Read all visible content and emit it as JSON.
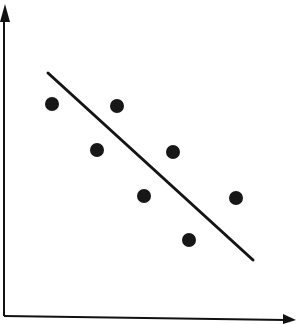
{
  "figure": {
    "kind": "scatter-plot-with-trend-line",
    "width": 297,
    "height": 324,
    "background_color": "#ffffff",
    "ink_color": "#171717",
    "title": "",
    "subtitle": ""
  },
  "axes": {
    "y_axis": {
      "label": "",
      "color": "#111111",
      "stroke_width": 2,
      "x": 4,
      "y_top": 16,
      "y_bottom": 316,
      "arrow": {
        "name": "y-axis-arrowhead",
        "direction": "up",
        "tip_x": 5,
        "tip_y": 4,
        "left_x": 0,
        "right_x": 10,
        "base_y": 22
      }
    },
    "x_axis": {
      "label": "",
      "color": "#111111",
      "stroke_width": 2,
      "x_left": 4,
      "y_left": 316,
      "x_right": 285,
      "y_right": 320,
      "arrow": {
        "name": "x-axis-arrowhead",
        "direction": "right",
        "tip_x": 296,
        "tip_y": 320,
        "top_y": 314,
        "bottom_y": 324,
        "base_x": 283
      }
    }
  },
  "trend_line": {
    "name": "regression-line",
    "color": "#141414",
    "stroke_width": 3,
    "x1": 48,
    "y1": 73,
    "x2": 253,
    "y2": 260,
    "direction": "negative"
  },
  "chart_data": {
    "type": "scatter",
    "title": "",
    "xlabel": "",
    "ylabel": "",
    "grid": false,
    "legend": false,
    "legend_position": "none",
    "xlim": [
      0,
      297
    ],
    "ylim": [
      0,
      324
    ],
    "axis_ticks": {
      "x": [],
      "y": []
    },
    "point_radius": 7,
    "point_color": "#171717",
    "series": [
      {
        "name": "observations",
        "marker": "filled-circle",
        "color": "#171717",
        "points": [
          {
            "id": "p1",
            "cx": 52,
            "cy": 104
          },
          {
            "id": "p2",
            "cx": 117,
            "cy": 106
          },
          {
            "id": "p3",
            "cx": 97,
            "cy": 150
          },
          {
            "id": "p4",
            "cx": 173,
            "cy": 152
          },
          {
            "id": "p5",
            "cx": 144,
            "cy": 196
          },
          {
            "id": "p6",
            "cx": 236,
            "cy": 198
          },
          {
            "id": "p7",
            "cx": 189,
            "cy": 240
          }
        ]
      }
    ],
    "fit_line": {
      "name": "line-of-best-fit",
      "type": "linear",
      "x": [
        48,
        253
      ],
      "y": [
        73,
        260
      ],
      "slope_pixels": 0.912,
      "trend": "decreasing"
    },
    "annotations": []
  }
}
